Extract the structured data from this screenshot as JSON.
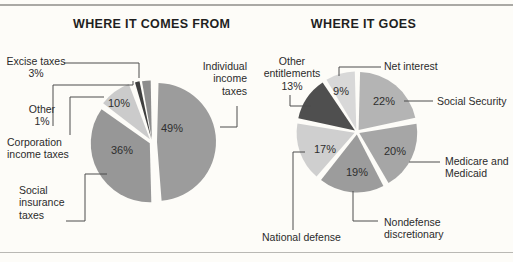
{
  "chart_data": [
    {
      "type": "pie",
      "title": "WHERE IT COMES FROM",
      "center": [
        152,
        142
      ],
      "radius": 59,
      "slices": [
        {
          "label": "Individual income taxes",
          "value": 49,
          "pct_text": "49%",
          "color": "#9c9c9c",
          "start": 1.5,
          "end": 175.5,
          "explode": 5,
          "pct_xy": [
            172,
            132
          ]
        },
        {
          "label": "Social insurance taxes",
          "value": 36,
          "pct_text": "36%",
          "color": "#979797",
          "start": 178.5,
          "end": 305.0,
          "explode": 2.5,
          "pct_xy": [
            122,
            154
          ]
        },
        {
          "label": "Corporation income taxes",
          "value": 10,
          "pct_text": "10%",
          "color": "#cbcbcb",
          "start": 307.5,
          "end": 339.0,
          "explode": 3.5,
          "pct_xy": [
            119,
            107
          ]
        },
        {
          "label": "Other",
          "value": 1,
          "pct_text": "1%",
          "color": "#3f3f3f",
          "start": 344.0,
          "end": 348.5,
          "explode": 3
        },
        {
          "label": "Excise taxes",
          "value": 3,
          "pct_text": "3%",
          "color": "#8d8d8d",
          "start": 350.5,
          "end": 359.0,
          "explode": 2.5
        }
      ]
    },
    {
      "type": "pie",
      "title": "WHERE IT GOES",
      "center": [
        357,
        132
      ],
      "radius": 58,
      "slices": [
        {
          "label": "Social Security",
          "value": 22,
          "pct_text": "22%",
          "color": "#b4b4b4",
          "start": 1.5,
          "end": 77.7,
          "explode": 2.5,
          "pct_xy": [
            384,
            105
          ]
        },
        {
          "label": "Medicare and Medicaid",
          "value": 20,
          "pct_text": "20%",
          "color": "#a6a6a6",
          "start": 80.7,
          "end": 149.7,
          "explode": 2.5,
          "pct_xy": [
            395,
            155
          ]
        },
        {
          "label": "Nondefense discretionary",
          "value": 19,
          "pct_text": "19%",
          "color": "#9c9c9c",
          "start": 152.7,
          "end": 218.1,
          "explode": 2.5,
          "pct_xy": [
            357,
            176
          ]
        },
        {
          "label": "National defense",
          "value": 17,
          "pct_text": "17%",
          "color": "#cfcfcf",
          "start": 221.1,
          "end": 279.3,
          "explode": 2.5,
          "pct_xy": [
            325,
            153
          ]
        },
        {
          "label": "Other entitlements",
          "value": 13,
          "pct_text": "13%",
          "color": "#4f4f4f",
          "start": 282.3,
          "end": 326.1,
          "explode": 2.5
        },
        {
          "label": "Net interest",
          "value": 9,
          "pct_text": "9%",
          "color": "#d8d8d8",
          "start": 329.1,
          "end": 358.5,
          "explode": 2.5,
          "pct_xy": [
            341,
            95
          ]
        }
      ]
    }
  ]
}
